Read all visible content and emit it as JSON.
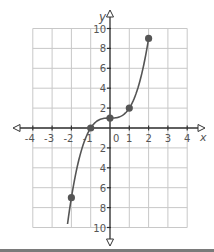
{
  "chart_data": {
    "type": "line",
    "title": "",
    "xlabel": "x",
    "ylabel": "y",
    "xlim": [
      -4,
      4
    ],
    "ylim": [
      -10,
      10
    ],
    "grid": true,
    "x_ticks": [
      -4,
      -3,
      -2,
      -1,
      0,
      1,
      2,
      3,
      4
    ],
    "x_tick_labels": [
      "-4",
      "-3",
      "-2",
      "-1",
      "0",
      "1",
      "2",
      "3",
      "4"
    ],
    "y_ticks": [
      -10,
      -8,
      -6,
      -4,
      -2,
      2,
      4,
      6,
      8,
      10
    ],
    "y_tick_labels": [
      "10",
      "8",
      "6",
      "4",
      "2",
      "2",
      "4",
      "6",
      "8",
      "10"
    ],
    "origin_label": "0",
    "series": [
      {
        "name": "f(x) = x^3 + 1",
        "curve": "cubic",
        "x_range": [
          -2.2,
          2
        ],
        "points": [
          {
            "x": -2,
            "y": -7
          },
          {
            "x": -1,
            "y": 0
          },
          {
            "x": 0,
            "y": 1
          },
          {
            "x": 1,
            "y": 2
          },
          {
            "x": 2,
            "y": 9
          }
        ]
      }
    ],
    "colors": {
      "curve": "#555555",
      "point": "#555555",
      "grid": "#c8c8c8",
      "axis": "#333333",
      "label": "#555555"
    }
  }
}
